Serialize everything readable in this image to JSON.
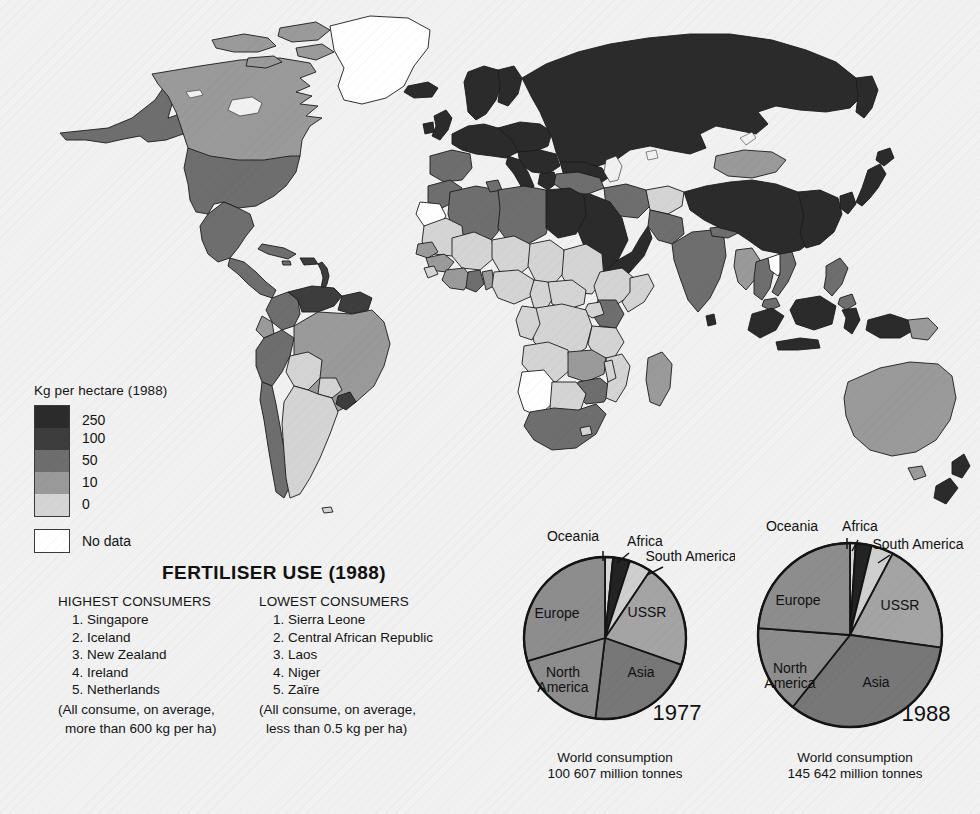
{
  "legend": {
    "title": "Kg per hectare (1988)",
    "ramp": [
      {
        "label": "250",
        "color": "#2b2b2b"
      },
      {
        "label": "100",
        "color": "#3d3d3d"
      },
      {
        "label": "50",
        "color": "#6e6e6e"
      },
      {
        "label": "10",
        "color": "#9a9a9a"
      },
      {
        "label": "0",
        "color": "#d4d4d4"
      }
    ],
    "nodata_label": "No data",
    "nodata_color": "#ffffff"
  },
  "fertiliser": {
    "title": "FERTILISER USE (1988)",
    "highest": {
      "heading": "HIGHEST CONSUMERS",
      "items": [
        "Singapore",
        "Iceland",
        "New Zealand",
        "Ireland",
        "Netherlands"
      ],
      "note_line1": "(All consume, on average,",
      "note_line2": "more than 600 kg per ha)"
    },
    "lowest": {
      "heading": "LOWEST CONSUMERS",
      "items": [
        "Sierra Leone",
        "Central African Republic",
        "Laos",
        "Niger",
        "Zaïre"
      ],
      "note_line1": "(All consume, on average,",
      "note_line2": "less than 0.5 kg per ha)"
    }
  },
  "chart_data": [
    {
      "type": "pie",
      "title": "1977",
      "subtitle_line1": "World consumption",
      "subtitle_line2": "100 607 million tonnes",
      "total_million_tonnes": 100607,
      "start_angle_deg": 0,
      "direction": "clockwise",
      "categories": [
        "Oceania",
        "Africa",
        "South America",
        "USSR",
        "Asia",
        "North America",
        "Europe"
      ],
      "values": [
        1.6,
        3.4,
        4.4,
        21.0,
        21.5,
        18.5,
        29.6
      ],
      "unit": "percent",
      "colors": [
        "#d8d8d8",
        "#232323",
        "#cfcfcf",
        "#a4a4a4",
        "#777777",
        "#8d8d8d",
        "#8d8d8d"
      ],
      "labels_inside": [
        "USSR",
        "Asia",
        "North America",
        "Europe"
      ],
      "labels_outside": [
        "Oceania",
        "Africa",
        "South America"
      ]
    },
    {
      "type": "pie",
      "title": "1988",
      "subtitle_line1": "World consumption",
      "subtitle_line2": "145 642 million tonnes",
      "total_million_tonnes": 145642,
      "start_angle_deg": 0,
      "direction": "clockwise",
      "categories": [
        "Oceania",
        "Africa",
        "South America",
        "USSR",
        "Asia",
        "North America",
        "Europe"
      ],
      "values": [
        1.0,
        2.8,
        3.9,
        19.5,
        33.5,
        15.5,
        23.8
      ],
      "unit": "percent",
      "colors": [
        "#d8d8d8",
        "#232323",
        "#cfcfcf",
        "#a4a4a4",
        "#777777",
        "#8d8d8d",
        "#8d8d8d"
      ],
      "labels_inside": [
        "USSR",
        "Asia",
        "North America",
        "Europe"
      ],
      "labels_outside": [
        "Oceania",
        "Africa",
        "South America"
      ]
    }
  ],
  "map": {
    "name": "world-choropleth-fertiliser-1988",
    "ocean_color": "#f1f1f1",
    "border_color": "#1b1b1b",
    "classes": {
      "c250": "#2b2b2b",
      "c100": "#3d3d3d",
      "c50": "#6e6e6e",
      "c10": "#9a9a9a",
      "c0": "#d4d4d4",
      "nd": "#ffffff"
    }
  }
}
